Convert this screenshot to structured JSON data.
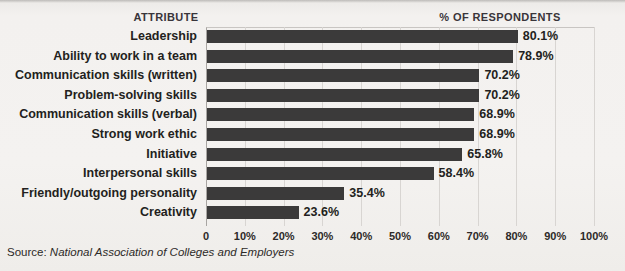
{
  "headers": {
    "attribute": "ATTRIBUTE",
    "respondents": "% OF RESPONDENTS"
  },
  "source": {
    "label": "Source:",
    "value": "National Association of Colleges and Employers"
  },
  "style": {
    "bar_color": "#3b3a3a",
    "background_color": "#f2f0ed",
    "gridline_color": "#d8d5d2",
    "text_color": "#231f20"
  },
  "chart_data": {
    "type": "bar",
    "orientation": "horizontal",
    "title": "",
    "subtitle": "",
    "xlabel": "% OF RESPONDENTS",
    "ylabel": "ATTRIBUTE",
    "xlim": [
      0,
      100
    ],
    "grid": true,
    "legend": false,
    "categories": [
      "Leadership",
      "Ability to work in a team",
      "Communication skills (written)",
      "Problem-solving skills",
      "Communication skills (verbal)",
      "Strong work ethic",
      "Initiative",
      "Interpersonal skills",
      "Friendly/outgoing personality",
      "Creativity"
    ],
    "values": [
      80.1,
      78.9,
      70.2,
      70.2,
      68.9,
      68.9,
      65.8,
      58.4,
      35.4,
      23.6
    ],
    "value_labels": [
      "80.1%",
      "78.9%",
      "70.2%",
      "70.2%",
      "68.9%",
      "68.9%",
      "65.8%",
      "58.4%",
      "35.4%",
      "23.6%"
    ],
    "xticks": [
      0,
      10,
      20,
      30,
      40,
      50,
      60,
      70,
      80,
      90,
      100
    ],
    "xtick_labels": [
      "0",
      "10%",
      "20%",
      "30%",
      "40%",
      "50%",
      "60%",
      "70%",
      "80%",
      "90%",
      "100%"
    ]
  }
}
